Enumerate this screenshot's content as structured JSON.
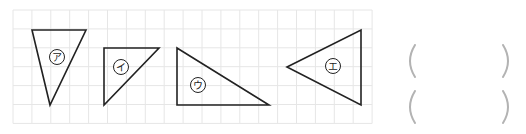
{
  "grid": {
    "x0": 13,
    "y0": 10,
    "cell": 18.9,
    "cols": 19,
    "rows": 6,
    "line_color": "#e6e6e6"
  },
  "shapes": [
    {
      "id": "a",
      "label": "ア",
      "points": [
        [
          32,
          30
        ],
        [
          86,
          30
        ],
        [
          50,
          105
        ]
      ],
      "label_pos": [
        57,
        57
      ]
    },
    {
      "id": "i",
      "label": "イ",
      "points": [
        [
          104,
          48
        ],
        [
          159,
          48
        ],
        [
          104,
          105
        ]
      ],
      "label_pos": [
        121,
        67
      ]
    },
    {
      "id": "u",
      "label": "ウ",
      "points": [
        [
          177,
          48
        ],
        [
          177,
          105
        ],
        [
          269,
          105
        ]
      ],
      "label_pos": [
        198,
        85
      ]
    },
    {
      "id": "e",
      "label": "エ",
      "points": [
        [
          287,
          67
        ],
        [
          361,
          30
        ],
        [
          361,
          105
        ]
      ],
      "label_pos": [
        333,
        66
      ]
    }
  ],
  "answers": [
    {
      "value": "",
      "top": 44
    },
    {
      "value": "",
      "top": 90
    }
  ],
  "colors": {
    "stroke": "#222222",
    "paren": "#b3b3b3"
  }
}
